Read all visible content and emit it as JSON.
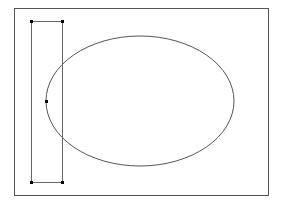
{
  "canvas": {
    "width": 283,
    "height": 202,
    "background": "#ffffff",
    "stroke_color": "#555555"
  },
  "frame": {
    "x": 14,
    "y": 8,
    "width": 254,
    "height": 187
  },
  "ellipse": {
    "cx": 140,
    "cy": 101,
    "rx": 94,
    "ry": 65
  },
  "bounding_box": {
    "x": 31,
    "y": 21,
    "width": 31,
    "height": 161
  },
  "handles": [
    {
      "x": 31,
      "y": 21
    },
    {
      "x": 62,
      "y": 21
    },
    {
      "x": 31,
      "y": 182
    },
    {
      "x": 62,
      "y": 182
    },
    {
      "x": 46,
      "y": 101
    }
  ]
}
